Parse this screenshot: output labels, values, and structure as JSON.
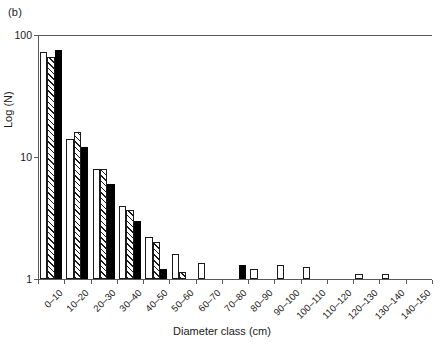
{
  "panel": {
    "label": "(b)"
  },
  "chart_data": {
    "type": "bar",
    "title": "",
    "subtitle": "",
    "panel_label": "(b)",
    "xlabel": "Diameter class (cm)",
    "ylabel": "Log (N)",
    "yscale": "log",
    "ylim": [
      1,
      100
    ],
    "ytick_labels": [
      "1",
      "10",
      "100"
    ],
    "ytick_values": [
      1,
      10,
      100
    ],
    "grid": false,
    "legend": "none",
    "categories": [
      "0–10",
      "10–20",
      "20–30",
      "30–40",
      "40–50",
      "50–60",
      "60–70",
      "70–80",
      "80–90",
      "90–100",
      "100–110",
      "110–120",
      "120–130",
      "130–140",
      "140–150"
    ],
    "series": [
      {
        "name": "series-open",
        "style": "open",
        "values": [
          72,
          14,
          8,
          4,
          2.2,
          1.6,
          1.35,
          0,
          1.2,
          1.3,
          1.25,
          0,
          1.1,
          1.1,
          0
        ]
      },
      {
        "name": "series-hatched",
        "style": "hatched",
        "values": [
          66,
          16,
          8,
          3.7,
          2.0,
          1.15,
          0,
          0,
          0,
          0,
          0,
          0,
          0,
          0,
          0
        ]
      },
      {
        "name": "series-solid",
        "style": "solid",
        "values": [
          76,
          12,
          6,
          3,
          1.2,
          0,
          0,
          1.3,
          0,
          0,
          0,
          0,
          0,
          0,
          0
        ]
      }
    ]
  }
}
